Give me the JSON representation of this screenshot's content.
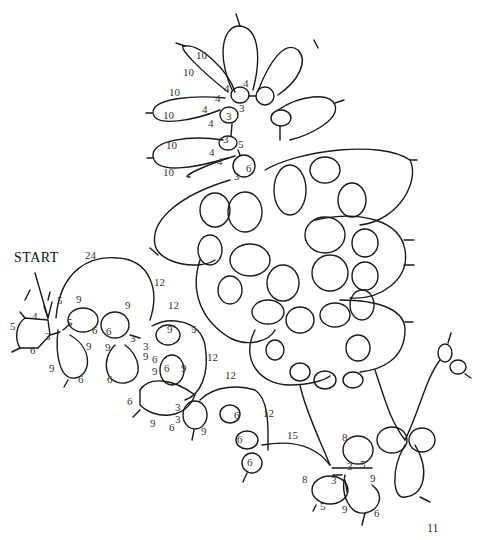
{
  "diagram": {
    "type": "tatting-pattern",
    "start_label": "START",
    "page_number": "11",
    "stroke_color": "#1a1a1a",
    "background": "#ffffff",
    "stitch_counts": [
      {
        "text": "10",
        "x": 199,
        "y": 56
      },
      {
        "text": "10",
        "x": 186,
        "y": 73
      },
      {
        "text": "10",
        "x": 172,
        "y": 93
      },
      {
        "text": "10",
        "x": 166,
        "y": 116
      },
      {
        "text": "10",
        "x": 169,
        "y": 146
      },
      {
        "text": "10",
        "x": 166,
        "y": 173
      },
      {
        "text": "4",
        "x": 246,
        "y": 84
      },
      {
        "text": "4",
        "x": 227,
        "y": 89
      },
      {
        "text": "3",
        "x": 242,
        "y": 109
      },
      {
        "text": "4",
        "x": 218,
        "y": 99
      },
      {
        "text": "4",
        "x": 205,
        "y": 110
      },
      {
        "text": "3",
        "x": 229,
        "y": 117
      },
      {
        "text": "4",
        "x": 211,
        "y": 124
      },
      {
        "text": "3",
        "x": 226,
        "y": 140
      },
      {
        "text": "4",
        "x": 212,
        "y": 153
      },
      {
        "text": "5",
        "x": 241,
        "y": 145
      },
      {
        "text": "4",
        "x": 220,
        "y": 162
      },
      {
        "text": "6",
        "x": 249,
        "y": 169
      },
      {
        "text": "3",
        "x": 237,
        "y": 177
      },
      {
        "text": "24",
        "x": 88,
        "y": 256
      },
      {
        "text": "12",
        "x": 157,
        "y": 283
      },
      {
        "text": "5",
        "x": 60,
        "y": 301
      },
      {
        "text": "9",
        "x": 79,
        "y": 300
      },
      {
        "text": "9",
        "x": 128,
        "y": 306
      },
      {
        "text": "4",
        "x": 35,
        "y": 317
      },
      {
        "text": "5",
        "x": 13,
        "y": 327
      },
      {
        "text": "5",
        "x": 70,
        "y": 323
      },
      {
        "text": "6",
        "x": 95,
        "y": 331
      },
      {
        "text": "6",
        "x": 109,
        "y": 332
      },
      {
        "text": "3",
        "x": 48,
        "y": 337
      },
      {
        "text": "3",
        "x": 133,
        "y": 339
      },
      {
        "text": "3",
        "x": 146,
        "y": 347
      },
      {
        "text": "9",
        "x": 89,
        "y": 347
      },
      {
        "text": "9",
        "x": 108,
        "y": 348
      },
      {
        "text": "6",
        "x": 33,
        "y": 351
      },
      {
        "text": "12",
        "x": 171,
        "y": 306
      },
      {
        "text": "9",
        "x": 170,
        "y": 330
      },
      {
        "text": "5",
        "x": 194,
        "y": 330
      },
      {
        "text": "9",
        "x": 146,
        "y": 357
      },
      {
        "text": "6",
        "x": 155,
        "y": 360
      },
      {
        "text": "12",
        "x": 210,
        "y": 358
      },
      {
        "text": "9",
        "x": 52,
        "y": 369
      },
      {
        "text": "6",
        "x": 81,
        "y": 380
      },
      {
        "text": "6",
        "x": 110,
        "y": 380
      },
      {
        "text": "9",
        "x": 155,
        "y": 372
      },
      {
        "text": "6",
        "x": 167,
        "y": 369
      },
      {
        "text": "9",
        "x": 184,
        "y": 369
      },
      {
        "text": "6",
        "x": 130,
        "y": 402
      },
      {
        "text": "3",
        "x": 178,
        "y": 408
      },
      {
        "text": "12",
        "x": 228,
        "y": 376
      },
      {
        "text": "3",
        "x": 178,
        "y": 420
      },
      {
        "text": "9",
        "x": 153,
        "y": 424
      },
      {
        "text": "6",
        "x": 172,
        "y": 428
      },
      {
        "text": "9",
        "x": 204,
        "y": 432
      },
      {
        "text": "12",
        "x": 266,
        "y": 414
      },
      {
        "text": "6",
        "x": 237,
        "y": 416
      },
      {
        "text": "6",
        "x": 240,
        "y": 440
      },
      {
        "text": "15",
        "x": 290,
        "y": 436
      },
      {
        "text": "8",
        "x": 345,
        "y": 438
      },
      {
        "text": "6",
        "x": 250,
        "y": 463
      },
      {
        "text": "3",
        "x": 350,
        "y": 467
      },
      {
        "text": "5",
        "x": 363,
        "y": 465
      },
      {
        "text": "9",
        "x": 373,
        "y": 479
      },
      {
        "text": "8",
        "x": 305,
        "y": 480
      },
      {
        "text": "3",
        "x": 334,
        "y": 481
      },
      {
        "text": "5",
        "x": 323,
        "y": 507
      },
      {
        "text": "9",
        "x": 345,
        "y": 510
      },
      {
        "text": "6",
        "x": 377,
        "y": 514
      }
    ]
  }
}
